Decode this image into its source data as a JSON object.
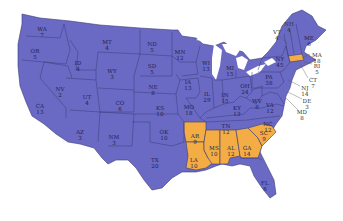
{
  "map": {
    "title": "",
    "colors": {
      "party_a": "#6a6ac4",
      "party_b": "#f3ad44",
      "background": "#ffffff"
    },
    "states": [
      {
        "abbr": "WA",
        "votes": "7",
        "party": "a",
        "x": 42,
        "y": 27
      },
      {
        "abbr": "OR",
        "votes": "5",
        "party": "a",
        "x": 35,
        "y": 49
      },
      {
        "abbr": "CA",
        "votes": "13",
        "party": "a",
        "x": 40,
        "y": 104
      },
      {
        "abbr": "NV",
        "votes": "2",
        "party": "a",
        "x": 60,
        "y": 87
      },
      {
        "abbr": "ID",
        "votes": "4",
        "party": "a",
        "x": 78,
        "y": 61
      },
      {
        "abbr": "MT",
        "votes": "4",
        "party": "a",
        "x": 107,
        "y": 40
      },
      {
        "abbr": "WY",
        "votes": "3",
        "party": "a",
        "x": 112,
        "y": 69
      },
      {
        "abbr": "UT",
        "votes": "4",
        "party": "a",
        "x": 87,
        "y": 95
      },
      {
        "abbr": "AZ",
        "votes": "3",
        "party": "a",
        "x": 80,
        "y": 130
      },
      {
        "abbr": "CO",
        "votes": "6",
        "party": "a",
        "x": 120,
        "y": 101
      },
      {
        "abbr": "NM",
        "votes": "3",
        "party": "a",
        "x": 114,
        "y": 135
      },
      {
        "abbr": "ND",
        "votes": "5",
        "party": "a",
        "x": 152,
        "y": 42
      },
      {
        "abbr": "SD",
        "votes": "5",
        "party": "a",
        "x": 152,
        "y": 64
      },
      {
        "abbr": "NE",
        "votes": "8",
        "party": "a",
        "x": 153,
        "y": 85
      },
      {
        "abbr": "KS",
        "votes": "10",
        "party": "a",
        "x": 160,
        "y": 106
      },
      {
        "abbr": "OK",
        "votes": "10",
        "party": "a",
        "x": 164,
        "y": 130
      },
      {
        "abbr": "TX",
        "votes": "20",
        "party": "a",
        "x": 155,
        "y": 158
      },
      {
        "abbr": "MN",
        "votes": "12",
        "party": "a",
        "x": 180,
        "y": 50
      },
      {
        "abbr": "IA",
        "votes": "13",
        "party": "a",
        "x": 188,
        "y": 80
      },
      {
        "abbr": "MO",
        "votes": "18",
        "party": "a",
        "x": 189,
        "y": 105
      },
      {
        "abbr": "WI",
        "votes": "13",
        "party": "a",
        "x": 206,
        "y": 61
      },
      {
        "abbr": "IL",
        "votes": "29",
        "party": "a",
        "x": 207,
        "y": 92
      },
      {
        "abbr": "MI",
        "votes": "15",
        "party": "a",
        "x": 230,
        "y": 66
      },
      {
        "abbr": "IN",
        "votes": "15",
        "party": "a",
        "x": 225,
        "y": 93
      },
      {
        "abbr": "OH",
        "votes": "24",
        "party": "a",
        "x": 245,
        "y": 84
      },
      {
        "abbr": "KY",
        "votes": "13",
        "party": "a",
        "x": 237,
        "y": 106
      },
      {
        "abbr": "WV",
        "votes": "8",
        "party": "a",
        "x": 257,
        "y": 99
      },
      {
        "abbr": "TN",
        "votes": "12",
        "party": "a",
        "x": 226,
        "y": 124
      },
      {
        "abbr": "PA",
        "votes": "38",
        "party": "a",
        "x": 269,
        "y": 75
      },
      {
        "abbr": "VA",
        "votes": "12",
        "party": "a",
        "x": 270,
        "y": 103
      },
      {
        "abbr": "NC",
        "votes": "12",
        "party": "a",
        "x": 268,
        "y": 122
      },
      {
        "abbr": "NY",
        "votes": "45",
        "party": "a",
        "x": 280,
        "y": 57
      },
      {
        "abbr": "ME",
        "votes": "6",
        "party": "a",
        "x": 309,
        "y": 36
      },
      {
        "abbr": "FL",
        "votes": "6",
        "party": "a",
        "x": 265,
        "y": 181
      },
      {
        "abbr": "AR",
        "votes": "9",
        "party": "b",
        "x": 195,
        "y": 134
      },
      {
        "abbr": "LA",
        "votes": "10",
        "party": "b",
        "x": 194,
        "y": 158
      },
      {
        "abbr": "MS",
        "votes": "10",
        "party": "b",
        "x": 214,
        "y": 146
      },
      {
        "abbr": "AL",
        "votes": "12",
        "party": "b",
        "x": 231,
        "y": 146
      },
      {
        "abbr": "GA",
        "votes": "14",
        "party": "b",
        "x": 247,
        "y": 146
      },
      {
        "abbr": "SC",
        "votes": "9",
        "party": "b",
        "x": 264,
        "y": 131
      }
    ],
    "callouts": [
      {
        "abbr": "NH",
        "votes": "4",
        "x": 289,
        "y": 22
      },
      {
        "abbr": "VT",
        "votes": "4",
        "x": 277,
        "y": 30
      },
      {
        "abbr": "MA",
        "votes": "18",
        "x": 317,
        "y": 53
      },
      {
        "abbr": "RI",
        "votes": "5",
        "x": 317,
        "y": 64
      },
      {
        "abbr": "CT",
        "votes": "7",
        "x": 313,
        "y": 78
      },
      {
        "abbr": "NJ",
        "votes": "14",
        "x": 305,
        "y": 86
      },
      {
        "abbr": "DE",
        "votes": "3",
        "x": 307,
        "y": 99
      },
      {
        "abbr": "MD",
        "votes": "8",
        "x": 302,
        "y": 110
      }
    ]
  }
}
